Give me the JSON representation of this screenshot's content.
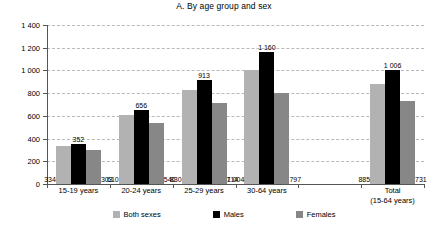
{
  "chart_data": {
    "type": "bar",
    "title": "A. By age group and sex",
    "xlabel": "",
    "ylabel": "",
    "ylim": [
      0,
      1400
    ],
    "yticks": [
      0,
      200,
      400,
      600,
      800,
      1000,
      1200,
      1400
    ],
    "ytick_labels": [
      "0",
      "200",
      "400",
      "600",
      "800",
      "1 000",
      "1 200",
      "1 400"
    ],
    "grid": true,
    "legend_position": "bottom",
    "categories": [
      "15-19 years",
      "20-24 years",
      "25-29 years",
      "30-64 years",
      "",
      "Total\n(15-64 years)"
    ],
    "category_lines": [
      [
        "15-19 years"
      ],
      [
        "20-24 years"
      ],
      [
        "25-29 years"
      ],
      [
        "30-64 years"
      ],
      [
        ""
      ],
      [
        "Total",
        "(15-64 years)"
      ]
    ],
    "series": [
      {
        "name": "Both sexes",
        "color": "#b2b2b2",
        "values": [
          334,
          610,
          830,
          1004,
          null,
          885
        ],
        "labels": [
          "334",
          "610",
          "830",
          "1 004",
          "",
          "885"
        ]
      },
      {
        "name": "Males",
        "color": "#000000",
        "values": [
          352,
          656,
          913,
          1160,
          null,
          1006
        ],
        "labels": [
          "352",
          "656",
          "913",
          "1 160",
          "",
          "1 006"
        ]
      },
      {
        "name": "Females",
        "color": "#878787",
        "values": [
          303,
          540,
          714,
          797,
          null,
          731
        ],
        "labels": [
          "303",
          "540",
          "714",
          "797",
          "",
          "731"
        ]
      }
    ]
  },
  "legend": {
    "items": [
      {
        "label": "Both sexes"
      },
      {
        "label": "Males"
      },
      {
        "label": "Females"
      }
    ]
  },
  "axis": {
    "y": {
      "t0": "0",
      "t1": "200",
      "t2": "400",
      "t3": "600",
      "t4": "800",
      "t5": "1 000",
      "t6": "1 200",
      "t7": "1 400"
    },
    "x": {
      "c0": "15-19 years",
      "c1": "20-24 years",
      "c2": "25-29 years",
      "c3": "30-64 years",
      "c5a": "Total",
      "c5b": "(15-64 years)"
    }
  },
  "values": {
    "g0": {
      "both": "334",
      "males": "352",
      "females": "303"
    },
    "g1": {
      "both": "610",
      "males": "656",
      "females": "540"
    },
    "g2": {
      "both": "830",
      "males": "913",
      "females": "714"
    },
    "g3": {
      "both": "1 004",
      "males": "1 160",
      "females": "797"
    },
    "g5": {
      "both": "885",
      "males": "1 006",
      "females": "731"
    }
  }
}
